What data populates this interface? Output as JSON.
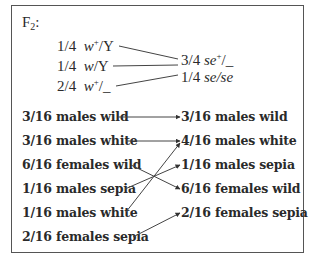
{
  "diagram": {
    "title": "F",
    "title_subscript": "2",
    "title_suffix": ":",
    "genotypes_left": [
      {
        "fraction": "1/4",
        "allele": "w",
        "sup": "+",
        "rest": "/Y"
      },
      {
        "fraction": "1/4",
        "allele": "w",
        "sup": "",
        "rest": "/Y"
      },
      {
        "fraction": "2/4",
        "allele": "w",
        "sup": "+",
        "rest": "/_"
      }
    ],
    "genotypes_right": [
      {
        "fraction": "3/4",
        "allele": "se",
        "sup": "+",
        "rest": "/_"
      },
      {
        "fraction": "1/4",
        "allele": "se/se",
        "sup": "",
        "rest": ""
      }
    ],
    "phenotypes_left": [
      "3/16 males wild",
      "3/16 males white",
      "6/16 females wild",
      "1/16 males sepia",
      "1/16 males white",
      "2/16 females sepia"
    ],
    "phenotypes_right": [
      "3/16 males wild",
      "4/16 males white",
      "1/16 males sepia",
      "6/16 females wild",
      "2/16 females sepia"
    ],
    "connections": [
      {
        "from": "3/16 males wild",
        "to": "3/16 males wild"
      },
      {
        "from": "3/16 males white",
        "to": "4/16 males white"
      },
      {
        "from": "6/16 females wild",
        "to": "6/16 females wild"
      },
      {
        "from": "1/16 males sepia",
        "to": "1/16 males sepia"
      },
      {
        "from": "1/16 males white",
        "to": "4/16 males white"
      },
      {
        "from": "2/16 females sepia",
        "to": "2/16 females sepia"
      }
    ]
  }
}
